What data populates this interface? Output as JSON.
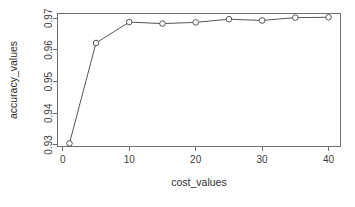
{
  "chart_data": {
    "type": "line",
    "title": "",
    "subtitle": "",
    "xlabel": "cost_values",
    "ylabel": "accuracy_values",
    "x": [
      1,
      5,
      10,
      15,
      20,
      25,
      30,
      35,
      40
    ],
    "values": [
      0.9305,
      0.9622,
      0.9688,
      0.9683,
      0.9687,
      0.9697,
      0.9693,
      0.9702,
      0.9703
    ],
    "series": [
      {
        "name": "accuracy_values",
        "x": [
          1,
          5,
          10,
          15,
          20,
          25,
          30,
          35,
          40
        ],
        "values": [
          0.9305,
          0.9622,
          0.9688,
          0.9683,
          0.9687,
          0.9697,
          0.9693,
          0.9702,
          0.9703
        ]
      }
    ],
    "xlim": [
      -0.8,
      41.8
    ],
    "ylim": [
      0.9295,
      0.9715
    ],
    "xticks": [
      0,
      10,
      20,
      30,
      40
    ],
    "xtick_labels": [
      "0",
      "10",
      "20",
      "30",
      "40"
    ],
    "yticks": [
      0.93,
      0.94,
      0.95,
      0.96,
      0.97
    ],
    "ytick_labels": [
      "0.93",
      "0.94",
      "0.95",
      "0.96",
      "0.97"
    ],
    "grid": false,
    "legend": null,
    "legend_position": "none",
    "marker": "open-circle",
    "line_color": "#555555",
    "marker_edge_color": "#555555",
    "marker_fill_color": "#ffffff",
    "axis_color": "#6e6e6e",
    "background_color": "#ffffff",
    "annotations": []
  },
  "labels": {
    "x_axis_title": "cost_values",
    "y_axis_title": "accuracy_values"
  }
}
